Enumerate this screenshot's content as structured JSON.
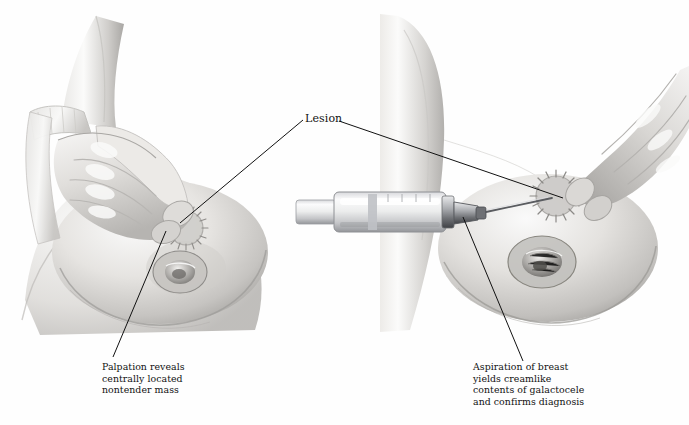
{
  "figure": {
    "background_color": "#ffffff",
    "ink_color": "#111111",
    "style": "grayscale medical illustration"
  },
  "labels": {
    "lesion": "Lesion"
  },
  "captions": {
    "left": {
      "lines": [
        "Palpation reveals",
        "centrally located",
        "nontender mass"
      ],
      "line1": "Palpation reveals",
      "line2": "centrally located",
      "line3": "nontender mass"
    },
    "right": {
      "lines": [
        "Aspiration of breast",
        "yields creamlike",
        "contents of galactocele",
        "and confirms diagnosis"
      ],
      "line1": "Aspiration of breast",
      "line2": "yields creamlike",
      "line3": "contents of galactocele",
      "line4": "and confirms diagnosis"
    }
  },
  "panels": {
    "left": {
      "name": "palpation-panel",
      "description": "Hand palpating the breast, fingertips over the lesion"
    },
    "right": {
      "name": "aspiration-panel",
      "description": "Syringe with needle aspirating the lesion while fingers stabilize it"
    }
  },
  "colors": {
    "skin_light": "#f2f1ef",
    "skin_mid": "#d8d6d3",
    "skin_shadow": "#b3b1ae",
    "skin_deep": "#8e8c89",
    "outline": "#6f6d6a",
    "metal_light": "#f4f4f5",
    "metal_mid": "#c9cacd",
    "metal_dark": "#7c7e83",
    "line": "#111111"
  }
}
